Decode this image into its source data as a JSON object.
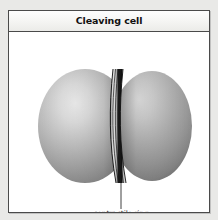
{
  "figure": {
    "title": "Cleaving cell",
    "background_color": "#e9e9e7",
    "panel_background": "#ffffff",
    "border_color": "#4a4a4a",
    "header_background": "#f4f4f2"
  },
  "diagram": {
    "type": "biological illustration",
    "parts": [
      {
        "name": "left daughter lobe",
        "shape": "sphere",
        "fill_light": "#e2e2e2",
        "fill_mid": "#a8a8a8",
        "fill_dark": "#7d7d7d"
      },
      {
        "name": "right daughter lobe",
        "shape": "sphere",
        "fill_light": "#dadada",
        "fill_mid": "#a4a4a4",
        "fill_dark": "#7a7a7a"
      },
      {
        "name": "contractile ring",
        "shape": "striped filament bundle",
        "stripe_dark": "#1d1d1d",
        "stripe_light": "#d8d8d8",
        "stripe_count": 7
      }
    ],
    "callouts": [
      {
        "label": "contractile ring",
        "leader_color": "#2a2a2a",
        "target": "cleavage furrow between the two lobes"
      }
    ]
  }
}
